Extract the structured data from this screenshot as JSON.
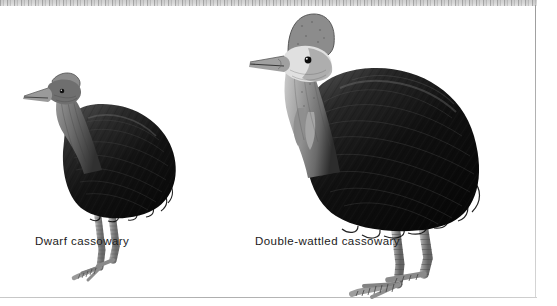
{
  "plate": {
    "background_color": "#ffffff",
    "border_color": "#b0b0b0",
    "illustration_style": "engraving",
    "ink_color": "#101010",
    "leg_color": "#8e8e8e"
  },
  "figures": [
    {
      "id": "dwarf-cassowary",
      "caption": "Dwarf cassowary",
      "caption_x": 35,
      "caption_y": 229,
      "relative_size": "smaller",
      "features": {
        "casque": "low",
        "bill": "grey",
        "neck": "grey",
        "body": "black plumage",
        "legs": "grey scaled",
        "facing": "left"
      }
    },
    {
      "id": "double-wattled-cassowary",
      "caption": "Double-wattled cassowary",
      "caption_x": 255,
      "caption_y": 229,
      "relative_size": "larger",
      "features": {
        "casque": "tall",
        "bill": "grey",
        "neck": "pale grey with wattles",
        "body": "black plumage",
        "legs": "grey scaled",
        "facing": "left"
      }
    }
  ]
}
